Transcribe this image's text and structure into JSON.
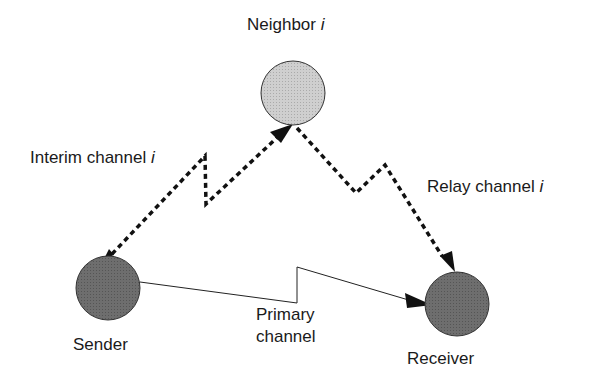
{
  "diagram": {
    "nodes": {
      "neighbor": {
        "label": "Neighbor",
        "suffix": "i",
        "fill": "#c8c8c8"
      },
      "sender": {
        "label": "Sender",
        "fill": "#6e6e6e"
      },
      "receiver": {
        "label": "Receiver",
        "fill": "#6e6e6e"
      }
    },
    "edges": {
      "interim": {
        "label": "Interim channel",
        "suffix": "i",
        "style": "dashed"
      },
      "relay": {
        "label": "Relay channel",
        "suffix": "i",
        "style": "dashed"
      },
      "primary": {
        "line1": "Primary",
        "line2": "channel",
        "style": "solid"
      }
    },
    "colors": {
      "stroke": "#111111",
      "background": "#ffffff"
    }
  }
}
